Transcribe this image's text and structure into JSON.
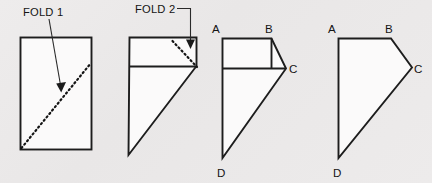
{
  "figure": {
    "background_color": "#eceaea",
    "shape_fill_color": "#fbfafa",
    "line_color": "#1d1d1d",
    "annotations": {
      "fold1_label": "FOLD 1",
      "fold2_label": "FOLD 2"
    },
    "vertex_labels": {
      "step3": {
        "a": "A",
        "b": "B",
        "c": "C",
        "d": "D"
      },
      "step4": {
        "a": "A",
        "b": "B",
        "c": "C",
        "d": "D"
      }
    },
    "steps": [
      {
        "index": 1,
        "name": "rectangle-with-fold1-crease",
        "description": "Plain rectangle with a dashed diagonal crease line marked FOLD 1"
      },
      {
        "index": 2,
        "name": "folded-once-with-fold2-crease",
        "description": "Shape after first fold, with dashed crease marked FOLD 2"
      },
      {
        "index": 3,
        "name": "folded-twice-labeled",
        "description": "Shape after second fold with vertices labeled A B C D"
      },
      {
        "index": 4,
        "name": "final-shape-labeled",
        "description": "Final folded polygon with vertices labeled A B C D"
      }
    ]
  }
}
